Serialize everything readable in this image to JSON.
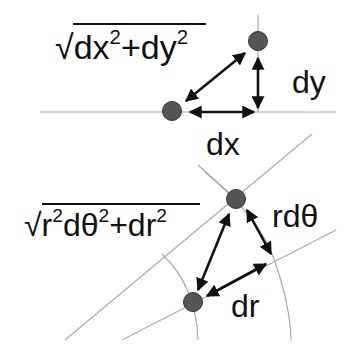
{
  "diagram": {
    "cartesian": {
      "formula": {
        "root": "√",
        "parts": [
          "dx",
          "2",
          "+dy",
          "2"
        ]
      },
      "labels": {
        "dx": "dx",
        "dy": "dy"
      }
    },
    "polar": {
      "formula": {
        "root": "√",
        "parts": [
          "r",
          "2",
          "dθ",
          "2",
          "+dr",
          "2"
        ]
      },
      "labels": {
        "rdtheta": "rdθ",
        "dr": "dr"
      }
    },
    "colors": {
      "point": "#555555",
      "point_stroke": "#333333",
      "arrow": "#111111",
      "guide": "#aaaaaa",
      "text": "#111111"
    }
  }
}
